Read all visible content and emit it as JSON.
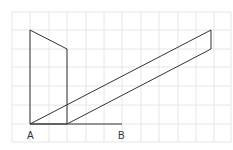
{
  "diagram": {
    "labels": {
      "a": "A",
      "b": "B"
    },
    "colors": {
      "grid": "#e6e6e6",
      "stroke": "#333333",
      "background": "#ffffff"
    },
    "grid": {
      "x0": 12,
      "y0": 12,
      "cell": 18.5,
      "cols": 12,
      "rows": 7
    },
    "points": {
      "A": [
        30,
        124
      ],
      "B": [
        122,
        124
      ]
    }
  }
}
